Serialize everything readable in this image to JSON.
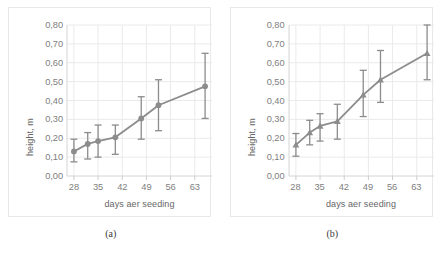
{
  "figure": {
    "panels": [
      {
        "caption": "(a)",
        "ylabel": "height, m",
        "xlabel": "days aer  seeding",
        "marker": "circle"
      },
      {
        "caption": "(b)",
        "ylabel": "height, m",
        "xlabel": "days aer  seeding",
        "marker": "triangle"
      }
    ],
    "series_color": "#8c8c8c",
    "grid_color": "#eaeaea",
    "text_color": "#808080"
  },
  "chart_data": [
    {
      "type": "line",
      "title": "(a)",
      "xlabel": "days aer  seeding",
      "ylabel": "height, m",
      "xlim": [
        26,
        68
      ],
      "ylim": [
        0.0,
        0.8
      ],
      "xticks": [
        28,
        35,
        42,
        49,
        56,
        63
      ],
      "ytick_labels": [
        "0,00",
        "0,10",
        "0,20",
        "0,30",
        "0,40",
        "0,50",
        "0,60",
        "0,70",
        "0,80"
      ],
      "yticks": [
        0.0,
        0.1,
        0.2,
        0.3,
        0.4,
        0.5,
        0.6,
        0.7,
        0.8
      ],
      "grid": true,
      "legend": "none",
      "marker": "circle",
      "x": [
        28,
        32,
        35,
        40,
        47.5,
        52.5,
        66
      ],
      "values": [
        0.13,
        0.17,
        0.185,
        0.205,
        0.305,
        0.375,
        0.475
      ],
      "err_low": [
        0.055,
        0.08,
        0.085,
        0.09,
        0.11,
        0.135,
        0.17
      ],
      "err_high": [
        0.065,
        0.06,
        0.085,
        0.065,
        0.115,
        0.135,
        0.175
      ]
    },
    {
      "type": "line",
      "title": "(b)",
      "xlabel": "days aer  seeding",
      "ylabel": "height, m",
      "xlim": [
        26,
        68
      ],
      "ylim": [
        0.0,
        0.8
      ],
      "xticks": [
        28,
        35,
        42,
        49,
        56,
        63
      ],
      "ytick_labels": [
        "0,00",
        "0,10",
        "0,20",
        "0,30",
        "0,40",
        "0,50",
        "0,60",
        "0,70",
        "0,80"
      ],
      "yticks": [
        0.0,
        0.1,
        0.2,
        0.3,
        0.4,
        0.5,
        0.6,
        0.7,
        0.8
      ],
      "grid": true,
      "legend": "none",
      "marker": "triangle",
      "x": [
        28,
        32,
        35,
        40,
        47.5,
        52.5,
        66
      ],
      "values": [
        0.165,
        0.23,
        0.265,
        0.29,
        0.43,
        0.51,
        0.65
      ],
      "err_low": [
        0.06,
        0.065,
        0.08,
        0.095,
        0.115,
        0.12,
        0.14
      ],
      "err_high": [
        0.06,
        0.065,
        0.065,
        0.09,
        0.13,
        0.155,
        0.15
      ]
    }
  ]
}
